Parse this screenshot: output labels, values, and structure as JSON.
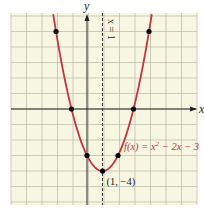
{
  "chart_data": {
    "type": "line",
    "title": "",
    "function_label": "f(x) = x² − 2x − 3",
    "function_label_parts": {
      "prefix": "f(x) = x",
      "exp": "2",
      "suffix": " − 2x − 3"
    },
    "xlabel": "x",
    "ylabel": "y",
    "xlim": [
      -5,
      7
    ],
    "ylim": [
      -6,
      6
    ],
    "grid": true,
    "axis_of_symmetry": {
      "x": 1,
      "label": "x = 1",
      "style": "dashed"
    },
    "vertex": {
      "x": 1,
      "y": -4,
      "label": "(1, −4)"
    },
    "points": [
      {
        "x": -2,
        "y": 5
      },
      {
        "x": -1,
        "y": 0
      },
      {
        "x": 0,
        "y": -3
      },
      {
        "x": 1,
        "y": -4
      },
      {
        "x": 2,
        "y": -3
      },
      {
        "x": 3,
        "y": 0
      },
      {
        "x": 4,
        "y": 5
      }
    ],
    "series": [
      {
        "name": "f(x) = x^2 - 2x - 3",
        "a": 1,
        "b": -2,
        "c": -3,
        "color": "#c8323f"
      }
    ]
  },
  "colors": {
    "background": "#f7f6e0",
    "grid": "#b9b9a8",
    "axis": "#222222",
    "curve": "#c8323f",
    "point": "#000000",
    "function_label": "#c8323f"
  }
}
